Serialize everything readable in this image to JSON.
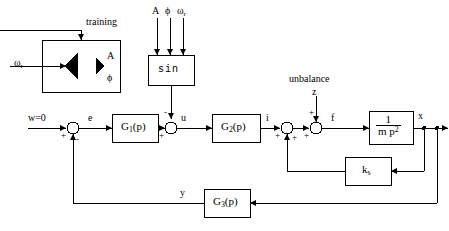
{
  "diagram": {
    "stroke_color": "#000000",
    "background": "#ffffff"
  },
  "labels": {
    "training": "training",
    "omega_r_input": "ω",
    "omega_r_sub": "r",
    "unbalance": "unbalance"
  },
  "nn_block": {
    "name": "neural-network",
    "outputs": [
      {
        "symbol": "A"
      },
      {
        "symbol": "ϕ"
      }
    ]
  },
  "sin_block": {
    "label": "sin",
    "inputs": [
      {
        "symbol": "A"
      },
      {
        "symbol": "ϕ"
      },
      {
        "symbol": "ω",
        "sub": "r"
      }
    ]
  },
  "blocks": [
    {
      "id": "g1",
      "label": "G",
      "sub": "1",
      "suffix": "(p)"
    },
    {
      "id": "g2",
      "label": "G",
      "sub": "2",
      "suffix": "(p)"
    },
    {
      "id": "g3",
      "label": "G",
      "sub": "3",
      "suffix": "(p)"
    },
    {
      "id": "plant",
      "numerator": "1",
      "denominator": "m p",
      "denominator_sup": "2"
    },
    {
      "id": "ks",
      "label": "k",
      "sub": "s"
    }
  ],
  "signals": {
    "reference": "w=0",
    "error": "e",
    "control": "u",
    "current": "i",
    "disturbance": "z",
    "force": "f",
    "position": "x",
    "feedback": "y"
  },
  "summing_junctions": [
    {
      "id": "sum1",
      "left": "+",
      "bottom": "-"
    },
    {
      "id": "sum2",
      "left": "+",
      "top": "-"
    },
    {
      "id": "sum3",
      "left": "+",
      "bottom": "+"
    },
    {
      "id": "sum4",
      "left": "+",
      "top": "+"
    }
  ]
}
